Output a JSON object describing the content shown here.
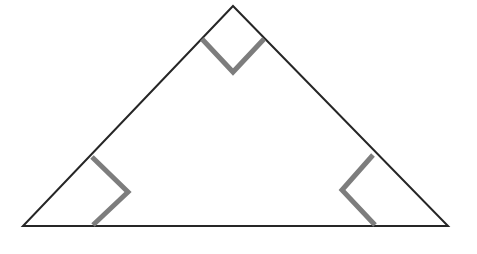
{
  "figure": {
    "name": "right-triangle-with-three-right-angle-marks",
    "background_color": "#ffffff",
    "canvas": {
      "width": 477,
      "height": 254
    },
    "outline": {
      "color": "#262626",
      "stroke_width": 2,
      "fill": "#ffffff"
    },
    "angle_mark": {
      "color": "#7d7d7d",
      "stroke_width": 5
    },
    "vertices": {
      "apex": {
        "label": "apex",
        "x": 233,
        "y": 6
      },
      "left": {
        "label": "left-base",
        "x": 23,
        "y": 226
      },
      "right": {
        "label": "right-base",
        "x": 448,
        "y": 226
      }
    },
    "triangle_path": "M 233 6 L 23 226 L 448 226 Z",
    "angle_marks": [
      {
        "name": "apex-right-angle-mark",
        "at_vertex": "apex",
        "path": "M 202 39 L 233 72 L 264 39"
      },
      {
        "name": "left-right-angle-mark",
        "at_vertex": "left-base",
        "path": "M 92 157 L 128 192 L 93 225"
      },
      {
        "name": "right-right-angle-mark",
        "at_vertex": "right-base",
        "path": "M 373 155 L 342 190 L 375 225"
      }
    ]
  }
}
